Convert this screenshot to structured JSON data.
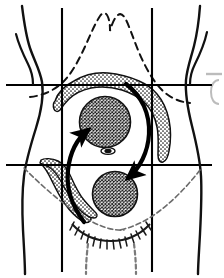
{
  "figure": {
    "title": "Abdominal anatomy diagram",
    "caption": "",
    "background_color": "#ffffff",
    "ink_color": "#000000",
    "stipple_color": "#8a8a8a",
    "width": 224,
    "height": 278
  },
  "diagram_data": {
    "type": "anatomical-line-drawing",
    "subject": "anterior abdominal wall with nine-region grid, colon, adnexal masses and migration arrows",
    "elements": [
      {
        "name": "torso-outline-left",
        "label": "Left flank / body contour",
        "style": "solid-stroke",
        "interactable": false
      },
      {
        "name": "torso-outline-right",
        "label": "Right flank / body contour",
        "style": "solid-stroke",
        "interactable": false
      },
      {
        "name": "costal-margin",
        "label": "Costal margin (rib cage)",
        "style": "dashed-stroke",
        "interactable": false
      },
      {
        "name": "region-grid",
        "label": "Nine abdominal regions grid",
        "style": "solid-stroke",
        "lines": {
          "vertical": [
            "left-midclavicular",
            "right-midclavicular"
          ],
          "horizontal": [
            "subcostal-plane",
            "intertubercular-plane"
          ]
        },
        "interactable": false
      },
      {
        "name": "colon",
        "label": "Colon (transverse, ascending and descending)",
        "style": "stippled-fill",
        "interactable": false
      },
      {
        "name": "upper-mass",
        "label": "Upper abdominal mass",
        "style": "cross-hatched-fill",
        "center": [
          105,
          122
        ],
        "radius": 25,
        "interactable": false
      },
      {
        "name": "lower-mass",
        "label": "Pelvic mass",
        "style": "cross-hatched-fill",
        "center": [
          115,
          194
        ],
        "radius": 22,
        "interactable": false
      },
      {
        "name": "umbilicus",
        "label": "Umbilicus (navel)",
        "style": "solid-fill",
        "center": [
          108,
          151
        ],
        "interactable": false
      },
      {
        "name": "arrow-ascending",
        "label": "Upward migration arrow",
        "style": "solid-curved-arrow",
        "direction": "upward-left",
        "interactable": false
      },
      {
        "name": "arrow-descending",
        "label": "Downward migration arrow",
        "style": "solid-curved-arrow",
        "direction": "downward-right",
        "interactable": false
      },
      {
        "name": "inguinal-creases",
        "label": "Inguinal / groin creases",
        "style": "hatched-stroke",
        "interactable": false
      },
      {
        "name": "pubic-hair",
        "label": "Pubic hair hatching",
        "style": "hatched-stroke",
        "interactable": false
      },
      {
        "name": "thigh-left",
        "label": "Left thigh contour",
        "style": "solid-stroke",
        "interactable": false
      },
      {
        "name": "thigh-right",
        "label": "Right thigh contour",
        "style": "solid-stroke",
        "interactable": false
      },
      {
        "name": "panel-edge-fragment",
        "label": "Adjacent panel fragment",
        "style": "faint-stroke",
        "interactable": false
      }
    ]
  }
}
